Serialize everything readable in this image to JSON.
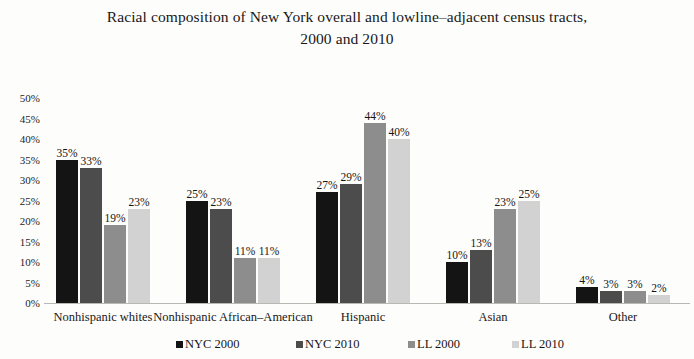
{
  "chart_data": {
    "type": "bar",
    "title": "Racial composition of New York overall and lowline–adjacent census tracts, 2000 and 2010",
    "title_line1": "Racial composition of New York overall and lowline–adjacent census tracts,",
    "title_line2": "2000 and 2010",
    "xlabel": "",
    "ylabel": "",
    "ylim": [
      0,
      50
    ],
    "ytick_labels": [
      "50%",
      "45%",
      "40%",
      "35%",
      "30%",
      "25%",
      "20%",
      "15%",
      "10%",
      "5%",
      "0%"
    ],
    "ytick_values": [
      50,
      45,
      40,
      35,
      30,
      25,
      20,
      15,
      10,
      5,
      0
    ],
    "grid": false,
    "legend_position": "bottom",
    "categories": [
      "Nonhispanic whites",
      "Nonhispanic African–American",
      "Hispanic",
      "Asian",
      "Other"
    ],
    "series": [
      {
        "name": "NYC 2000",
        "color": "#141414",
        "values": [
          35,
          25,
          27,
          10,
          4
        ],
        "labels": [
          "35%",
          "25%",
          "27%",
          "10%",
          "4%"
        ]
      },
      {
        "name": "NYC 2010",
        "color": "#4c4c4c",
        "values": [
          33,
          23,
          29,
          13,
          3
        ],
        "labels": [
          "33%",
          "23%",
          "29%",
          "13%",
          "3%"
        ]
      },
      {
        "name": "LL 2000",
        "color": "#8d8d8d",
        "values": [
          19,
          11,
          44,
          23,
          3
        ],
        "labels": [
          "19%",
          "11%",
          "44%",
          "23%",
          "3%"
        ]
      },
      {
        "name": "LL 2010",
        "color": "#d2d2d2",
        "values": [
          23,
          11,
          40,
          25,
          2
        ],
        "labels": [
          "23%",
          "11%",
          "40%",
          "25%",
          "2%"
        ]
      }
    ]
  },
  "legend": {
    "items": [
      {
        "label": "NYC 2000",
        "color": "#141414"
      },
      {
        "label": "NYC 2010",
        "color": "#4c4c4c"
      },
      {
        "label": "LL 2000",
        "color": "#8d8d8d"
      },
      {
        "label": "LL 2010",
        "color": "#d2d2d2"
      }
    ]
  }
}
